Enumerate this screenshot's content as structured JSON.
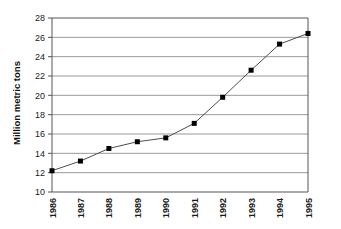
{
  "chart_data": {
    "type": "line",
    "title": "",
    "subtitle": "",
    "xlabel": "",
    "ylabel": "Million metric tons",
    "categories": [
      "1986",
      "1987",
      "1988",
      "1989",
      "1990",
      "1991",
      "1992",
      "1993",
      "1994",
      "1995"
    ],
    "values": [
      12.2,
      13.2,
      14.5,
      15.2,
      15.6,
      17.1,
      19.8,
      22.6,
      25.3,
      26.4
    ],
    "series": [
      {
        "name": "Million metric tons",
        "values": [
          12.2,
          13.2,
          14.5,
          15.2,
          15.6,
          17.1,
          19.8,
          22.6,
          25.3,
          26.4
        ]
      }
    ],
    "ylim": [
      10,
      28
    ],
    "yticks": [
      10,
      12,
      14,
      16,
      18,
      20,
      22,
      24,
      26,
      28
    ],
    "ytick_labels": [
      "10",
      "12",
      "14",
      "16",
      "18",
      "20",
      "22",
      "24",
      "26",
      "28"
    ],
    "xtick_labels": [
      "1986",
      "1987",
      "1988",
      "1989",
      "1990",
      "1991",
      "1992",
      "1993",
      "1994",
      "1995"
    ],
    "grid": {
      "horizontal": true,
      "vertical": false,
      "color": "#9a9a9a"
    },
    "legend": {
      "visible": false,
      "position": "none",
      "entries": []
    },
    "marker": {
      "shape": "square",
      "color": "#000000",
      "size": 5
    },
    "line": {
      "color": "#4d4d4d",
      "width": 1
    },
    "axis": {
      "frame": true,
      "frame_color": "#555555",
      "xtick_rotation": 90,
      "ytick_rotation": 0
    },
    "colors": {
      "background": "#ffffff",
      "text": "#1a1a1a",
      "grid": "#9a9a9a",
      "marker": "#000000",
      "line": "#4d4d4d"
    }
  },
  "labels": {
    "y_axis_title": "Million metric tons"
  }
}
